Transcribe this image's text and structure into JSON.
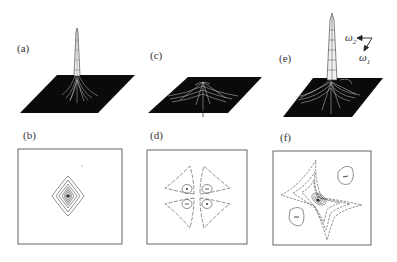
{
  "figure": {
    "panels": [
      {
        "id": "a",
        "label": "(a)",
        "type": "3d-surface",
        "description": "single sharp central peak"
      },
      {
        "id": "b",
        "label": "(b)",
        "type": "contour",
        "description": "concentric diamond-shaped contours around center"
      },
      {
        "id": "c",
        "label": "(c)",
        "type": "3d-surface",
        "description": "low cross-shaped ridges"
      },
      {
        "id": "d",
        "label": "(d)",
        "type": "contour",
        "description": "four-lobed dashed contours with four small extrema near center"
      },
      {
        "id": "e",
        "label": "(e)",
        "type": "3d-surface",
        "description": "tall sharp central peak with cross-shaped ridges"
      },
      {
        "id": "f",
        "label": "(f)",
        "type": "contour",
        "description": "skewed star-shaped contours with dense center and two side lobes"
      }
    ],
    "axes": {
      "w2_symbol": "ω",
      "w2_sub": "2",
      "w1_symbol": "ω",
      "w1_sub": "1"
    },
    "colors": {
      "surface": "#0a0a0a",
      "mesh": "#bdbdbd",
      "line": "#444444",
      "frame": "#555555"
    }
  }
}
